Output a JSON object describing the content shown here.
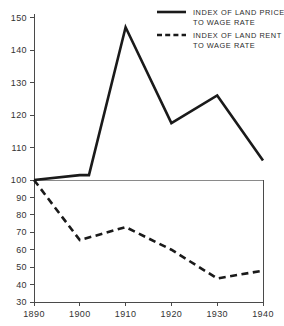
{
  "chart_data": {
    "type": "line",
    "title": "",
    "subtitle": "",
    "xlabel": "",
    "ylabel": "",
    "x": [
      1890,
      1900,
      1910,
      1920,
      1930,
      1940
    ],
    "xlim": [
      1890,
      1940
    ],
    "ylim": [
      30,
      150
    ],
    "grid": false,
    "y_axis_note": "piecewise scale: 100-150 expanded, 30-100 compressed; reference line at 100",
    "reference_line": 100,
    "legend_position": "top-right",
    "series": [
      {
        "name": "INDEX OF LAND PRICE TO WAGE RATE",
        "style": "solid",
        "color": "#1a1a1a",
        "values": [
          100,
          101.5,
          147,
          117.5,
          126,
          106
        ],
        "extra_points": [
          {
            "x": 1902,
            "y": 101.5
          }
        ]
      },
      {
        "name": "INDEX OF LAND RENT TO WAGE RATE",
        "style": "dashed",
        "color": "#1a1a1a",
        "values": [
          100,
          65.5,
          73,
          60,
          43.5,
          48
        ]
      }
    ],
    "y_ticks": [
      {
        "value": 150,
        "label": "150"
      },
      {
        "value": 140,
        "label": "140"
      },
      {
        "value": 130,
        "label": "130"
      },
      {
        "value": 120,
        "label": "120"
      },
      {
        "value": 110,
        "label": "110"
      },
      {
        "value": 100,
        "label": "100"
      },
      {
        "value": 90,
        "label": "90"
      },
      {
        "value": 80,
        "label": "80"
      },
      {
        "value": 70,
        "label": "70"
      },
      {
        "value": 60,
        "label": "60"
      },
      {
        "value": 50,
        "label": "50"
      },
      {
        "value": 40,
        "label": "40"
      },
      {
        "value": 30,
        "label": "30"
      }
    ],
    "x_ticks": [
      {
        "value": 1890,
        "label": "1890"
      },
      {
        "value": 1900,
        "label": "1900"
      },
      {
        "value": 1910,
        "label": "1910"
      },
      {
        "value": 1920,
        "label": "1920"
      },
      {
        "value": 1930,
        "label": "1930"
      },
      {
        "value": 1940,
        "label": "1940"
      }
    ]
  },
  "legend": {
    "entries": [
      {
        "line1": "INDEX OF LAND PRICE",
        "line2": "TO WAGE RATE",
        "style": "solid"
      },
      {
        "line1": "INDEX OF LAND RENT",
        "line2": "TO WAGE RATE",
        "style": "dashed"
      }
    ]
  }
}
